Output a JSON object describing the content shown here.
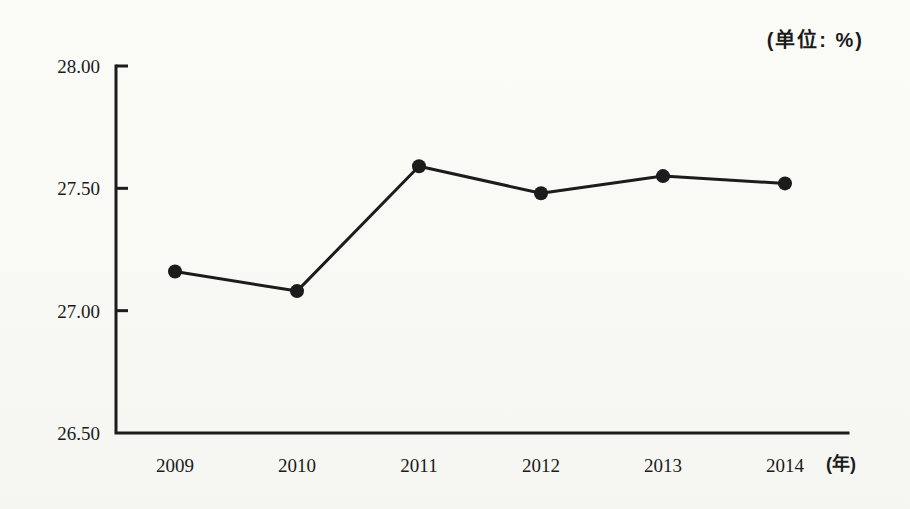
{
  "chart_data": {
    "type": "line",
    "title": "",
    "unit_note": "(单位: %)",
    "x_axis_suffix": "(年)",
    "categories": [
      "2009",
      "2010",
      "2011",
      "2012",
      "2013",
      "2014"
    ],
    "values": [
      27.16,
      27.08,
      27.59,
      27.48,
      27.55,
      27.52
    ],
    "y_tick_labels": [
      "28.00",
      "27.50",
      "27.00",
      "26.50"
    ],
    "y_tick_values": [
      28.0,
      27.5,
      27.0,
      26.5
    ],
    "ylim": [
      26.5,
      28.0
    ],
    "grid": false,
    "legend": "none",
    "line_color": "#1c1c1c",
    "marker": "filled-circle",
    "axis_color": "#1c1c1c",
    "paper_color": "#f9f9f6"
  }
}
